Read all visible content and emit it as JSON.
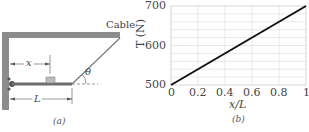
{
  "panel_a": {
    "caption": "(a)",
    "cable_label": "Cable",
    "angle_label": "θ",
    "x_label": "x",
    "length_label": "L",
    "colors": {
      "wall": "#8c8c8c",
      "beam": "#6f6f6f",
      "box": "#bdbdbd",
      "cable": "#7a7a7a"
    }
  },
  "panel_b": {
    "caption": "(b)",
    "ylabel": "T (N)",
    "xlabel": "x/L",
    "yticks": [
      "500",
      "600",
      "700"
    ],
    "xticks": [
      "0",
      "0.2",
      "0.4",
      "0.6",
      "0.8",
      "1"
    ]
  },
  "chart_data": {
    "type": "line",
    "title": "",
    "xlabel": "x/L",
    "ylabel": "T (N)",
    "x": [
      0,
      0.2,
      0.4,
      0.6,
      0.8,
      1.0
    ],
    "series": [
      {
        "name": "T",
        "values": [
          500,
          540,
          580,
          620,
          660,
          700
        ]
      }
    ],
    "xlim": [
      0,
      1
    ],
    "ylim": [
      500,
      700
    ],
    "grid": true,
    "legend": "none"
  }
}
